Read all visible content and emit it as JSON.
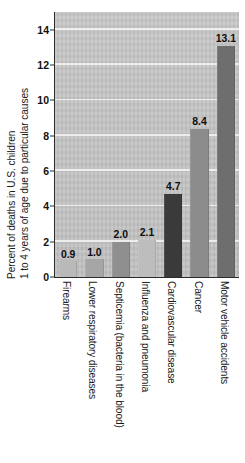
{
  "chart_data": {
    "type": "bar",
    "title": "",
    "subtitle": "",
    "xlabel": "",
    "ylabel_line1": "Percent of deaths in U.S. children",
    "ylabel_line2": "1 to 4 years of age due to particular causes",
    "ylim": [
      0,
      15
    ],
    "yticks": [
      0,
      2,
      4,
      6,
      8,
      10,
      12,
      14
    ],
    "ytick_labels": [
      "0",
      "2",
      "4",
      "6",
      "8",
      "10",
      "12",
      "14"
    ],
    "grid": true,
    "grid_axis": "y",
    "legend": "none",
    "categories": [
      "Firearms",
      "Lower respiratory diseases",
      "Septicemia (bacteria in the blood)",
      "Influenza and pneumonia",
      "Cardiovascular disease",
      "Cancer",
      "Motor vehicle accidents"
    ],
    "values": [
      0.9,
      1.0,
      2.0,
      2.1,
      4.7,
      8.4,
      13.1
    ],
    "value_labels": [
      "0.9",
      "1.0",
      "2.0",
      "2.1",
      "4.7",
      "8.4",
      "13.1"
    ],
    "bar_colors": [
      "#b9b9b9",
      "#a6a6a6",
      "#8f8f8f",
      "#bdbdbd",
      "#3a3a3a",
      "#8c8c8c",
      "#6e6e6e"
    ],
    "plot_background": "#c6c6c6",
    "gridline_color": "#efefef",
    "axis_color": "#2b2b2b",
    "text_color": "#111111"
  }
}
